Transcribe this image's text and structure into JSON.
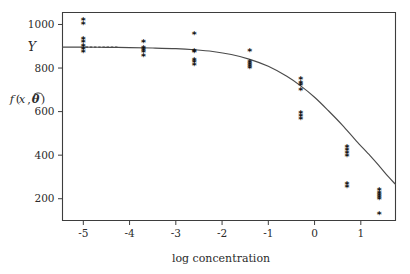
{
  "figure": {
    "background_color": "#ffffff",
    "axis_color": "#3d3d3d",
    "curve_color": "#4a4a4a",
    "marker_color": "#121212",
    "marker_glyph": "*"
  },
  "labels": {
    "xlabel": "log concentration",
    "ylabel_response": "Y",
    "ylabel_fit_f": "f",
    "ylabel_fit_open": "(",
    "ylabel_fit_x": "x",
    "ylabel_fit_comma": ",",
    "ylabel_fit_theta": "θ",
    "ylabel_fit_hat": "̂",
    "ylabel_fit_close": ")",
    "ylabel_fit_full": "f(x, θ̂)"
  },
  "chart_data": {
    "type": "scatter",
    "title": "",
    "xlabel": "log concentration",
    "ylabel": "Y   f(x, θ̂)",
    "xlim": [
      -5.45,
      1.75
    ],
    "ylim": [
      100,
      1055
    ],
    "xticks": [
      -5,
      -4,
      -3,
      -2,
      -1,
      0,
      1
    ],
    "xtick_labels": [
      "-5",
      "-4",
      "-3",
      "-2",
      "-1",
      "0",
      "1"
    ],
    "yticks": [
      200,
      400,
      600,
      800,
      1000
    ],
    "ytick_labels": [
      "200",
      "400",
      "600",
      "800",
      "1000"
    ],
    "grid": false,
    "legend": false,
    "series": [
      {
        "name": "observed Y",
        "type": "scatter",
        "marker": "*",
        "points": [
          {
            "x": -5.0,
            "y": 1020
          },
          {
            "x": -5.0,
            "y": 1002
          },
          {
            "x": -5.0,
            "y": 932
          },
          {
            "x": -5.0,
            "y": 922
          },
          {
            "x": -5.0,
            "y": 900
          },
          {
            "x": -5.0,
            "y": 888
          },
          {
            "x": -5.0,
            "y": 872
          },
          {
            "x": -3.7,
            "y": 922
          },
          {
            "x": -3.7,
            "y": 892
          },
          {
            "x": -3.7,
            "y": 882
          },
          {
            "x": -3.7,
            "y": 872
          },
          {
            "x": -3.7,
            "y": 858
          },
          {
            "x": -2.6,
            "y": 958
          },
          {
            "x": -2.6,
            "y": 878
          },
          {
            "x": -2.6,
            "y": 872
          },
          {
            "x": -2.6,
            "y": 838
          },
          {
            "x": -2.6,
            "y": 826
          },
          {
            "x": -2.6,
            "y": 816
          },
          {
            "x": -1.4,
            "y": 878
          },
          {
            "x": -1.4,
            "y": 828
          },
          {
            "x": -1.4,
            "y": 818
          },
          {
            "x": -1.4,
            "y": 808
          },
          {
            "x": -1.4,
            "y": 800
          },
          {
            "x": -0.3,
            "y": 752
          },
          {
            "x": -0.3,
            "y": 734
          },
          {
            "x": -0.3,
            "y": 722
          },
          {
            "x": -0.3,
            "y": 700
          },
          {
            "x": -0.3,
            "y": 596
          },
          {
            "x": -0.3,
            "y": 578
          },
          {
            "x": -0.3,
            "y": 566
          },
          {
            "x": 0.7,
            "y": 436
          },
          {
            "x": 0.7,
            "y": 424
          },
          {
            "x": 0.7,
            "y": 412
          },
          {
            "x": 0.7,
            "y": 398
          },
          {
            "x": 0.7,
            "y": 266
          },
          {
            "x": 0.7,
            "y": 256
          },
          {
            "x": 1.4,
            "y": 240
          },
          {
            "x": 1.4,
            "y": 228
          },
          {
            "x": 1.4,
            "y": 216
          },
          {
            "x": 1.4,
            "y": 208
          },
          {
            "x": 1.4,
            "y": 200
          },
          {
            "x": 1.4,
            "y": 132
          }
        ]
      },
      {
        "name": "fitted curve f(x, theta-hat)",
        "type": "line",
        "points": [
          {
            "x": -5.45,
            "y": 896
          },
          {
            "x": -5.0,
            "y": 896
          },
          {
            "x": -4.5,
            "y": 895
          },
          {
            "x": -4.0,
            "y": 894
          },
          {
            "x": -3.5,
            "y": 892
          },
          {
            "x": -3.0,
            "y": 889
          },
          {
            "x": -2.6,
            "y": 884
          },
          {
            "x": -2.2,
            "y": 876
          },
          {
            "x": -1.8,
            "y": 862
          },
          {
            "x": -1.4,
            "y": 840
          },
          {
            "x": -1.0,
            "y": 808
          },
          {
            "x": -0.6,
            "y": 762
          },
          {
            "x": -0.3,
            "y": 718
          },
          {
            "x": 0.0,
            "y": 666
          },
          {
            "x": 0.3,
            "y": 604
          },
          {
            "x": 0.6,
            "y": 538
          },
          {
            "x": 0.9,
            "y": 466
          },
          {
            "x": 1.2,
            "y": 398
          },
          {
            "x": 1.4,
            "y": 350
          },
          {
            "x": 1.6,
            "y": 300
          },
          {
            "x": 1.75,
            "y": 266
          }
        ]
      }
    ]
  }
}
